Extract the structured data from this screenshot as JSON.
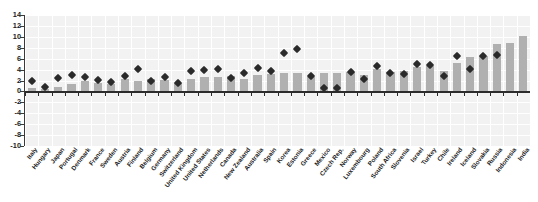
{
  "title": {
    "text": "",
    "cropped_note": "title row is clipped at top edge of screenshot"
  },
  "axis": {
    "y_ticks": [
      14,
      12,
      10,
      8,
      6,
      4,
      2,
      0,
      -2,
      -4,
      -6,
      -8,
      -10
    ]
  },
  "colors": {
    "bar": "#b0b0b0",
    "marker": "#2a2a2a",
    "plot_background": "#f2f2f2",
    "gridline": "#ffffff",
    "axis": "#2b2b2b",
    "page_background": "#ffffff"
  },
  "chart_data": {
    "type": "bar",
    "title": "",
    "xlabel": "",
    "ylabel": "",
    "ylim": [
      -10,
      14
    ],
    "ytick_step": 2,
    "grid": true,
    "legend": "none",
    "categories": [
      "Italy",
      "Hungary",
      "Japan",
      "Portugal",
      "Denmark",
      "France",
      "Sweden",
      "Austria",
      "Finland",
      "Belgium",
      "Germany",
      "Switzerland",
      "United Kingdom",
      "United States",
      "Netherlands",
      "Canada",
      "New Zealand",
      "Australia",
      "Spain",
      "Korea",
      "Estonia",
      "Greece",
      "Mexico",
      "Czech Rep.",
      "Norway",
      "Luxembourg",
      "Poland",
      "South Africa",
      "Slovenia",
      "Israel",
      "Turkey",
      "Chile",
      "Ireland",
      "Iceland",
      "Slovakia",
      "Russia",
      "Indonesia",
      "India"
    ],
    "series": [
      {
        "name": "bar",
        "type": "bar",
        "values": [
          0.7,
          0.4,
          0.8,
          1.4,
          1.9,
          1.5,
          1.4,
          2.2,
          1.9,
          2.3,
          2.1,
          1.5,
          2.3,
          2.6,
          2.7,
          2.9,
          2.3,
          3.0,
          3.2,
          3.4,
          3.4,
          2.7,
          3.4,
          3.4,
          3.6,
          3.1,
          4.1,
          3.6,
          3.7,
          4.5,
          4.7,
          3.7,
          5.2,
          6.3,
          6.4,
          8.6,
          8.8,
          10.2
        ]
      },
      {
        "name": "marker",
        "type": "scatter",
        "marker": "diamond",
        "values": [
          1.9,
          0.8,
          2.5,
          3.0,
          2.6,
          2.1,
          1.8,
          2.8,
          4.1,
          2.0,
          2.6,
          1.5,
          3.7,
          3.9,
          4.1,
          2.5,
          3.4,
          4.3,
          3.8,
          7.0,
          7.7,
          2.9,
          0.6,
          0.7,
          3.5,
          2.3,
          4.6,
          3.4,
          3.2,
          5.0,
          4.8,
          2.8,
          6.4,
          4.1,
          6.5,
          6.6,
          null,
          null
        ]
      }
    ]
  }
}
